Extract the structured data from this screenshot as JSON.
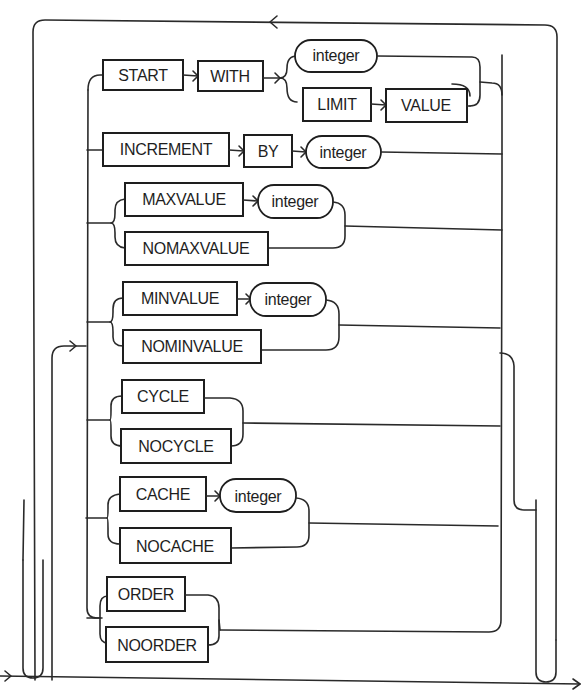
{
  "diagram": {
    "type": "railroad-syntax-diagram",
    "colors": {
      "line": "#2a2a2a",
      "box_stroke": "#1e1e1e",
      "background": "#ffffff"
    },
    "clauses": [
      {
        "name": "start-with",
        "keywords": [
          "START",
          "WITH"
        ],
        "alternatives": [
          {
            "kind": "terminal",
            "label": "integer"
          },
          {
            "kind": "sequence",
            "keywords": [
              "LIMIT",
              "VALUE"
            ]
          }
        ]
      },
      {
        "name": "increment-by",
        "keywords": [
          "INCREMENT",
          "BY"
        ],
        "terminal": "integer"
      },
      {
        "name": "maxvalue",
        "alternatives": [
          {
            "keywords": [
              "MAXVALUE"
            ],
            "terminal": "integer"
          },
          {
            "keywords": [
              "NOMAXVALUE"
            ]
          }
        ]
      },
      {
        "name": "minvalue",
        "alternatives": [
          {
            "keywords": [
              "MINVALUE"
            ],
            "terminal": "integer"
          },
          {
            "keywords": [
              "NOMINVALUE"
            ]
          }
        ]
      },
      {
        "name": "cycle",
        "alternatives": [
          {
            "keywords": [
              "CYCLE"
            ]
          },
          {
            "keywords": [
              "NOCYCLE"
            ]
          }
        ]
      },
      {
        "name": "cache",
        "alternatives": [
          {
            "keywords": [
              "CACHE"
            ],
            "terminal": "integer"
          },
          {
            "keywords": [
              "NOCACHE"
            ]
          }
        ]
      },
      {
        "name": "order",
        "alternatives": [
          {
            "keywords": [
              "ORDER"
            ]
          },
          {
            "keywords": [
              "NOORDER"
            ]
          }
        ]
      }
    ],
    "labels": {
      "start": "START",
      "with": "WITH",
      "integer": "integer",
      "limit": "LIMIT",
      "value": "VALUE",
      "increment": "INCREMENT",
      "by": "BY",
      "maxvalue": "MAXVALUE",
      "nomaxvalue": "NOMAXVALUE",
      "minvalue": "MINVALUE",
      "nominvalue": "NOMINVALUE",
      "cycle": "CYCLE",
      "nocycle": "NOCYCLE",
      "cache": "CACHE",
      "nocache": "NOCACHE",
      "order": "ORDER",
      "noorder": "NOORDER"
    }
  }
}
